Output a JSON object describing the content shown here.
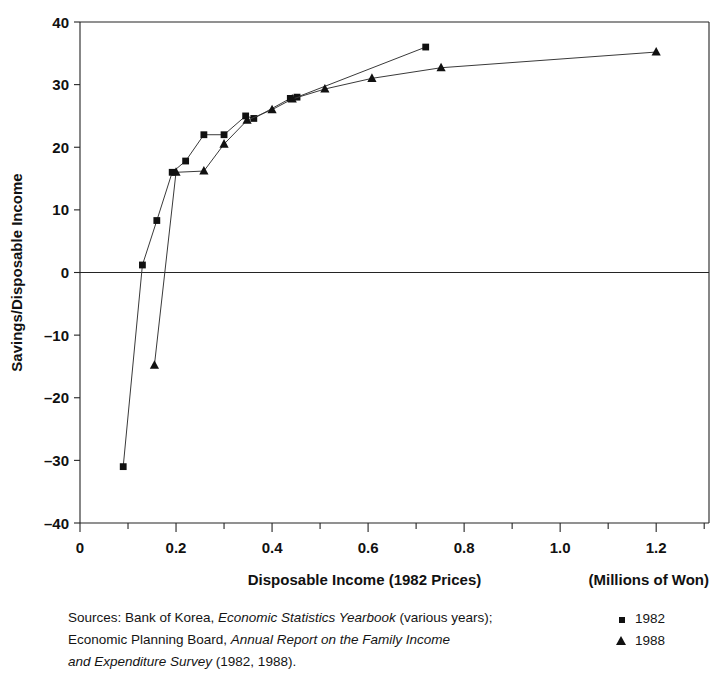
{
  "chart_data": {
    "type": "scatter",
    "title": "",
    "xlabel": "Disposable Income (1982 Prices)",
    "xlabel_unit": "(Millions of Won)",
    "ylabel": "Savings/Disposable Income",
    "xlim": [
      0,
      1.31
    ],
    "ylim": [
      -40,
      40
    ],
    "xticks": [
      0,
      0.2,
      0.4,
      0.6,
      0.8,
      1.0,
      1.2
    ],
    "xticklabels": [
      "0",
      "0.2",
      "0.4",
      "0.6",
      "0.8",
      "1.0",
      "1.2"
    ],
    "xminorticks": [
      0.1,
      0.3,
      0.5,
      0.7,
      0.9,
      1.1,
      1.3
    ],
    "yticks": [
      -40,
      -30,
      -20,
      -10,
      0,
      10,
      20,
      30,
      40
    ],
    "yticklabels": [
      "–40",
      "–30",
      "–20",
      "–10",
      "0",
      "10",
      "20",
      "30",
      "40"
    ],
    "grid": false,
    "legend_position": "bottom-right",
    "zero_line": true,
    "series": [
      {
        "name": "1982",
        "marker": "square",
        "color": "#111111",
        "points": [
          [
            0.09,
            -31.0
          ],
          [
            0.13,
            1.2
          ],
          [
            0.16,
            8.3
          ],
          [
            0.192,
            16.0
          ],
          [
            0.22,
            17.8
          ],
          [
            0.258,
            22.0
          ],
          [
            0.3,
            22.0
          ],
          [
            0.345,
            25.0
          ],
          [
            0.362,
            24.6
          ],
          [
            0.438,
            27.8
          ],
          [
            0.452,
            28.0
          ],
          [
            0.72,
            36.0
          ]
        ]
      },
      {
        "name": "1988",
        "marker": "triangle",
        "color": "#111111",
        "points": [
          [
            0.155,
            -14.8
          ],
          [
            0.2,
            16.0
          ],
          [
            0.258,
            16.2
          ],
          [
            0.3,
            20.5
          ],
          [
            0.348,
            24.3
          ],
          [
            0.4,
            26.0
          ],
          [
            0.442,
            27.7
          ],
          [
            0.51,
            29.3
          ],
          [
            0.608,
            31.0
          ],
          [
            0.752,
            32.7
          ],
          [
            1.2,
            35.2
          ]
        ]
      }
    ]
  },
  "footnote": {
    "line1_a": "Sources: Bank of Korea, ",
    "line1_italic": "Economic Statistics Yearbook",
    "line1_b": " (various years);",
    "line2_a": "Economic Planning Board, ",
    "line2_italic": "Annual Report on the Family Income",
    "line3_italic": "and Expenditure Survey",
    "line3_b": " (1982, 1988)."
  },
  "legend": {
    "items": [
      {
        "label": "1982",
        "marker": "square"
      },
      {
        "label": "1988",
        "marker": "triangle"
      }
    ]
  }
}
